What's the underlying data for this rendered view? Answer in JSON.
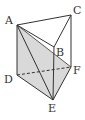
{
  "diagram": {
    "type": "triangular-prism",
    "vertices": {
      "A": {
        "label": "A",
        "x": 17,
        "y": 25
      },
      "B": {
        "label": "B",
        "x": 54,
        "y": 47
      },
      "C": {
        "label": "C",
        "x": 71,
        "y": 15
      },
      "D": {
        "label": "D",
        "x": 17,
        "y": 75
      },
      "E": {
        "label": "E",
        "x": 53,
        "y": 100
      },
      "F": {
        "label": "F",
        "x": 71,
        "y": 67
      }
    },
    "labels": {
      "A": "A",
      "B": "B",
      "C": "C",
      "D": "D",
      "E": "E",
      "F": "F"
    },
    "solid_edges": [
      "AC",
      "AB",
      "BC",
      "AD",
      "BE",
      "CF",
      "DE",
      "EF",
      "AE",
      "AF"
    ],
    "dashed_edges": [
      "DF"
    ],
    "shaded_region": [
      "A",
      "D",
      "E",
      "F"
    ],
    "colors": {
      "line": "#333333",
      "shade": "#d9d9d9"
    }
  }
}
